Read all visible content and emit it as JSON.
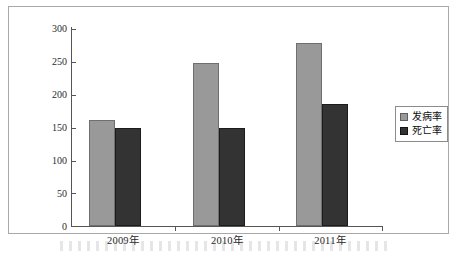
{
  "chart_data": {
    "type": "bar",
    "title": "",
    "xlabel": "",
    "ylabel": "",
    "categories": [
      "2009年",
      "2010年",
      "2011年"
    ],
    "series": [
      {
        "name": "发病率",
        "color": "#999999",
        "values": [
          162,
          248,
          279
        ]
      },
      {
        "name": "死亡率",
        "color": "#333333",
        "values": [
          149,
          150,
          186
        ]
      }
    ],
    "ylim": [
      0,
      300
    ],
    "ytick_values": [
      0,
      50,
      100,
      150,
      200,
      250,
      300
    ],
    "ytick_labels": [
      "0",
      "50",
      "100",
      "150",
      "200",
      "250",
      "300"
    ],
    "grid": false,
    "legend_position": "right"
  },
  "legend": {
    "entries": [
      {
        "label": "发病率"
      },
      {
        "label": "死亡率"
      }
    ]
  },
  "axis": {
    "y_labels": [
      "300",
      "250",
      "200",
      "150",
      "100",
      "50",
      "0"
    ],
    "x_labels": [
      "2009年",
      "2010年",
      "2011年"
    ]
  },
  "colors": {
    "series_incidence": "#999999",
    "series_mortality": "#333333",
    "axis": "#555555",
    "frame": "#a8a8a8",
    "background": "#ffffff"
  }
}
